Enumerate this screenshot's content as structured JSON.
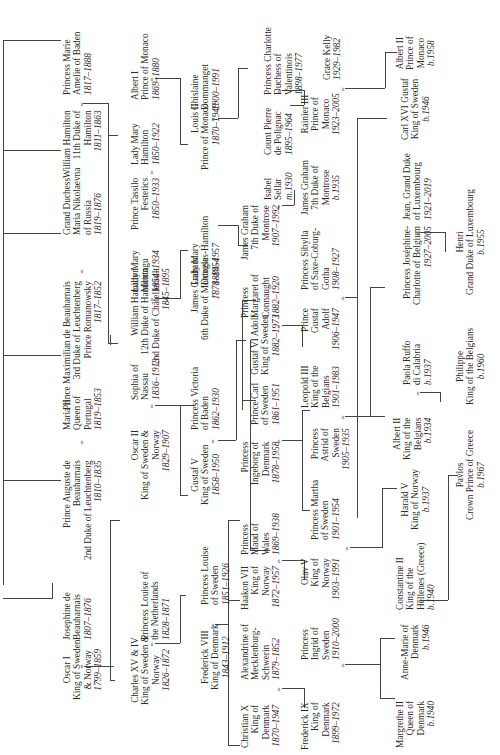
{
  "chart_title": "Royal family tree (rotated)",
  "people": {
    "oscar1": {
      "lines": [
        "Oscar I",
        "King of Sweden",
        "& Norway"
      ],
      "dates": "1799–1859"
    },
    "josephine": {
      "lines": [
        "Josephine de",
        "Beauharnais"
      ],
      "dates": "1807–1876"
    },
    "auguste": {
      "lines": [
        "Prince Auguste de",
        "Beauharnais",
        "2nd Duke of Leuchtenberg"
      ],
      "dates": "1810–1835"
    },
    "maria2": {
      "lines": [
        "Maria II",
        "Queen of",
        "Portugal"
      ],
      "dates": "1819–1853"
    },
    "maximilian": {
      "lines": [
        "Prince Maximilian de Beauharnais",
        "3rd Duke of Leuchtenberg",
        "Prince Romanowsky"
      ],
      "dates": "1817–1852"
    },
    "maria_nik": {
      "lines": [
        "Grand Duchess",
        "Maria Nikolaevna",
        "of Russia"
      ],
      "dates": "1819–1876"
    },
    "william11": {
      "lines": [
        "William Hamilton",
        "11th Duke of",
        "Hamilton"
      ],
      "dates": "1811–1863"
    },
    "marie_baden": {
      "lines": [
        "Princess Marie",
        "Amelie of Baden"
      ],
      "dates": "1817–1888"
    },
    "charles15": {
      "lines": [
        "Charles XV & IV",
        "King of Sweden &",
        "Norway"
      ],
      "dates": "1826–1872"
    },
    "louise_nl": {
      "lines": [
        "Princess Louise of",
        "the Netherlands"
      ],
      "dates": "1828–1871"
    },
    "oscar2": {
      "lines": [
        "Oscar II",
        "King of Sweden &",
        "Norway"
      ],
      "dates": "1829–1907"
    },
    "sophia": {
      "lines": [
        "Sophia of",
        "Nassau"
      ],
      "dates": "1836–1913"
    },
    "william12": {
      "lines": [
        "William Hamilton",
        "12th Duke of Hamilton",
        "2nd Duke of Châtellerault"
      ],
      "dates": "1845–1895"
    },
    "mary_montagu": {
      "lines": [
        "Lady Mary",
        "Montagu"
      ],
      "dates": "1854–1934"
    },
    "tassilo": {
      "lines": [
        "Prince Tassilo",
        "Festetics"
      ],
      "dates": "1850–1933"
    },
    "mary_hamilton": {
      "lines": [
        "Lady Mary",
        "Hamilton"
      ],
      "dates": "1850–1922"
    },
    "albert1": {
      "lines": [
        "Albert I",
        "Prince of Monaco"
      ],
      "dates": "1869–1880"
    },
    "frederick8": {
      "lines": [
        "Frederick VIII",
        "King of Denmark"
      ],
      "dates": "1843–1912"
    },
    "louise_se": {
      "lines": [
        "Princess Louise",
        "of Sweden"
      ],
      "dates": "1851–1926"
    },
    "gustaf5": {
      "lines": [
        "Gustaf V",
        "King of Sweden"
      ],
      "dates": "1858–1950"
    },
    "victoria_baden": {
      "lines": [
        "Princess Victoria",
        "of Baden"
      ],
      "dates": "1862–1930"
    },
    "james6": {
      "lines": [
        "James Graham",
        "6th Duke of Montrose"
      ],
      "dates": "1878–1954"
    },
    "mary_dh": {
      "lines": [
        "Lady Mary",
        "Douglas-Hamilton"
      ],
      "dates": "1884–1957"
    },
    "louis2": {
      "lines": [
        "Louis II",
        "Prince of Monaco"
      ],
      "dates": "1870–1949"
    },
    "ghislaine": {
      "lines": [
        "Ghislaine",
        "Dommanget"
      ],
      "dates": "1900–1991"
    },
    "christian10": {
      "lines": [
        "Christian X",
        "King of",
        "Denmark"
      ],
      "dates": "1870–1947"
    },
    "alexandrine": {
      "lines": [
        "Alexandrine of",
        "Mecklenburg-",
        "Schwerin"
      ],
      "dates": "1879–1852"
    },
    "haakon7": {
      "lines": [
        "Haakon VII",
        "King of",
        "Norway"
      ],
      "dates": "1872–1957"
    },
    "maud": {
      "lines": [
        "Princess",
        "Maud of",
        "Wales"
      ],
      "dates": "1869–1938"
    },
    "ingeborg": {
      "lines": [
        "Princess",
        "Ingeborg of",
        "Denmark"
      ],
      "dates": "1878–1958"
    },
    "carl": {
      "lines": [
        "Prince Carl",
        "of Sweden"
      ],
      "dates": "1861–1951"
    },
    "gustaf6": {
      "lines": [
        "Gustaf VI Adolf",
        "King of Sweden"
      ],
      "dates": "1882–1973"
    },
    "margaret": {
      "lines": [
        "Princess",
        "Margaret of",
        "Connaught"
      ],
      "dates": "1882–1920"
    },
    "james7a": {
      "lines": [
        "James Graham",
        "7th Duke of",
        "Montrose"
      ],
      "dates": "1907–1992"
    },
    "isabel": {
      "lines": [
        "Isabel",
        "Sellar"
      ],
      "dates": "m.1930"
    },
    "pierre": {
      "lines": [
        "Count Pierre",
        "de Polignac"
      ],
      "dates": "1895–1964"
    },
    "charlotte": {
      "lines": [
        "Princess Charlotte",
        "Duchess of",
        "Valentinois"
      ],
      "dates": "1898–1977"
    },
    "frederick9": {
      "lines": [
        "Frederick IX",
        "King of",
        "Denmark"
      ],
      "dates": "1899–1972"
    },
    "ingrid": {
      "lines": [
        "Princess",
        "Ingrid of",
        "Sweden"
      ],
      "dates": "1910–2000"
    },
    "olav5": {
      "lines": [
        "Olav V",
        "King of",
        "Norway"
      ],
      "dates": "1903–1991"
    },
    "martha": {
      "lines": [
        "Princess Martha",
        "of Sweden"
      ],
      "dates": "1901–1954"
    },
    "astrid": {
      "lines": [
        "Princess",
        "Astrid of",
        "Sweden"
      ],
      "dates": "1905–1935"
    },
    "leopold3": {
      "lines": [
        "Leopold III",
        "King of the",
        "Belgians"
      ],
      "dates": "1901–1983"
    },
    "gustaf_adolf": {
      "lines": [
        "Prince",
        "Gustaf",
        "Adolf"
      ],
      "dates": "1906–1947"
    },
    "sibylla": {
      "lines": [
        "Princess Sibylla",
        "of Saxe-Coburg-",
        "Gotha"
      ],
      "dates": "1908–1927"
    },
    "james7b": {
      "lines": [
        "James Graham",
        "7th Duke of",
        "Montrose"
      ],
      "dates": "b.1935"
    },
    "rainier3": {
      "lines": [
        "Rainier III",
        "Prince of",
        "Monaco"
      ],
      "dates": "1923–2005"
    },
    "grace": {
      "lines": [
        "Grace Kelly"
      ],
      "dates": "1929–1982"
    },
    "margrethe2": {
      "lines": [
        "Margrethe II",
        "Queen of",
        "Denmark"
      ],
      "dates": "b.1940"
    },
    "anne_marie": {
      "lines": [
        "Anne-Marie of",
        "Denmark"
      ],
      "dates": "b.1946"
    },
    "constantine2": {
      "lines": [
        "Constantine II",
        "King of the",
        "Hellenes (Greece)"
      ],
      "dates": "b.1940"
    },
    "harald5": {
      "lines": [
        "Harald V",
        "King of Norway"
      ],
      "dates": "b.1937"
    },
    "albert2_be": {
      "lines": [
        "Albert II",
        "King of the",
        "Belgians"
      ],
      "dates": "b.1934"
    },
    "paola": {
      "lines": [
        "Paola Ruffo",
        "di Calabria"
      ],
      "dates": "b.1937"
    },
    "josephine_charlotte": {
      "lines": [
        "Princess Joséphine-",
        "Charlotte of Belgium"
      ],
      "dates": "1927–2005"
    },
    "jean": {
      "lines": [
        "Jean, Grand Duke",
        "of Luxembourg"
      ],
      "dates": "1921–2019"
    },
    "carl16": {
      "lines": [
        "Carl XVI Gustaf",
        "King of Sweden"
      ],
      "dates": "b.1946"
    },
    "albert2_mc": {
      "lines": [
        "Albert II",
        "Prince of",
        "Monaco"
      ],
      "dates": "b.1958"
    },
    "pavlos": {
      "lines": [
        "Pavlos",
        "Crown Prince of Greece"
      ],
      "dates": "b.1967"
    },
    "philippe": {
      "lines": [
        "Philippe",
        "King of the Belgians"
      ],
      "dates": "b.1960"
    },
    "henri": {
      "lines": [
        "Henri",
        "Grand Duke of Luxembourg"
      ],
      "dates": "b.1955"
    }
  },
  "marriage_symbol": "="
}
